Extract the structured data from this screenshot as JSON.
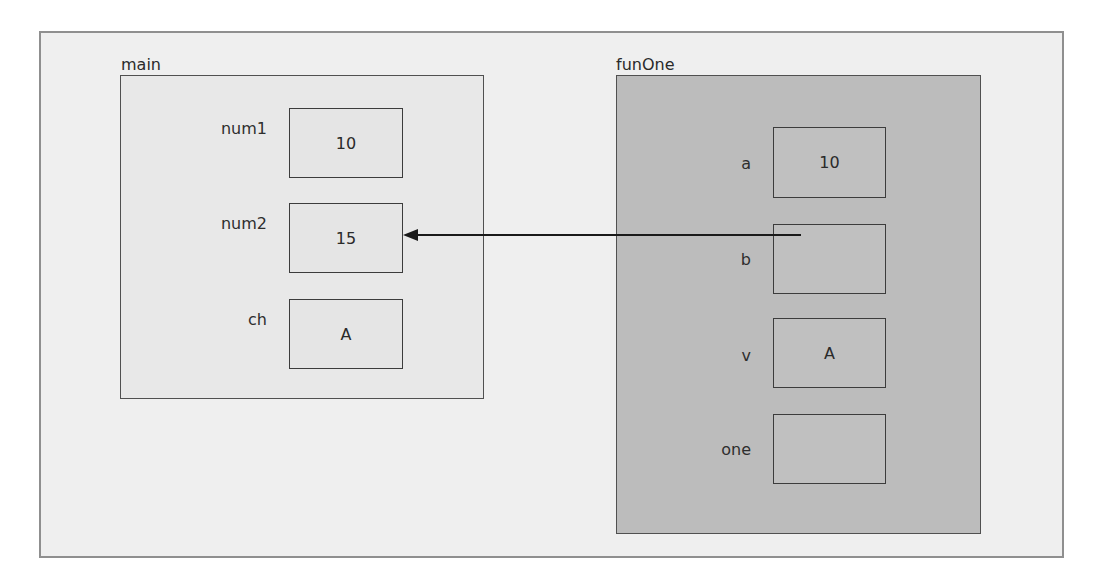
{
  "frames": {
    "main": {
      "title": "main",
      "variables": [
        {
          "name": "num1",
          "value": "10"
        },
        {
          "name": "num2",
          "value": "15"
        },
        {
          "name": "ch",
          "value": "A"
        }
      ]
    },
    "funOne": {
      "title": "funOne",
      "variables": [
        {
          "name": "a",
          "value": "10"
        },
        {
          "name": "b",
          "value": ""
        },
        {
          "name": "v",
          "value": "A"
        },
        {
          "name": "one",
          "value": ""
        }
      ]
    }
  },
  "arrow": {
    "from": "funOne.b",
    "to": "main.num2",
    "meaning": "reference parameter b refers to num2"
  },
  "colors": {
    "outer_bg": "#efefef",
    "main_bg": "#e8e8e8",
    "funOne_bg": "#bcbcbc",
    "border": "#3c3c3c"
  }
}
